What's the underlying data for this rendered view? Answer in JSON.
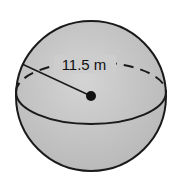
{
  "diagram": {
    "shape": "sphere",
    "radius_label": "11.5 m",
    "colors": {
      "fill": "#c9c9c9",
      "stroke": "#1a1a1a",
      "background": "#ffffff"
    }
  }
}
